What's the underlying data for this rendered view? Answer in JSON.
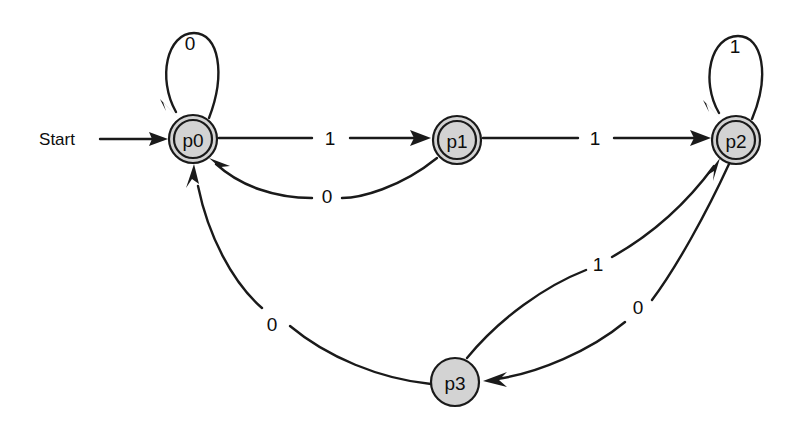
{
  "diagram": {
    "type": "state-machine",
    "background_color": "#ffffff",
    "stroke_color": "#1a1a1a",
    "node_fill_color": "#d3d3d3",
    "start_label": "Start",
    "alphabet": [
      "0",
      "1"
    ],
    "states": [
      {
        "id": "p0",
        "label": "p0",
        "accepting": true,
        "x": 193,
        "y": 139,
        "r_outer": 24,
        "r_inner": 19
      },
      {
        "id": "p1",
        "label": "p1",
        "accepting": true,
        "x": 457,
        "y": 140,
        "r_outer": 24,
        "r_inner": 19
      },
      {
        "id": "p2",
        "label": "p2",
        "accepting": true,
        "x": 736,
        "y": 140,
        "r_outer": 24,
        "r_inner": 19
      },
      {
        "id": "p3",
        "label": "p3",
        "accepting": false,
        "x": 455,
        "y": 382,
        "r_outer": 24,
        "r_inner": 0
      }
    ],
    "transitions": [
      {
        "id": "t-p0-p0",
        "from": "p0",
        "to": "p0",
        "label": "0",
        "label_x": 190,
        "label_y": 43,
        "kind": "self-loop"
      },
      {
        "id": "t-p0-p1",
        "from": "p0",
        "to": "p1",
        "label": "1",
        "label_x": 330,
        "label_y": 138,
        "kind": "straight"
      },
      {
        "id": "t-p1-p0",
        "from": "p1",
        "to": "p0",
        "label": "0",
        "label_x": 327,
        "label_y": 196,
        "kind": "curve"
      },
      {
        "id": "t-p1-p2",
        "from": "p1",
        "to": "p2",
        "label": "1",
        "label_x": 595,
        "label_y": 138,
        "kind": "straight"
      },
      {
        "id": "t-p2-p2",
        "from": "p2",
        "to": "p2",
        "label": "1",
        "label_x": 735,
        "label_y": 46,
        "kind": "self-loop"
      },
      {
        "id": "t-p2-p3",
        "from": "p2",
        "to": "p3",
        "label": "0",
        "label_x": 638,
        "label_y": 307,
        "kind": "curve"
      },
      {
        "id": "t-p3-p2",
        "from": "p3",
        "to": "p2",
        "label": "1",
        "label_x": 598,
        "label_y": 264,
        "kind": "curve"
      },
      {
        "id": "t-p3-p0",
        "from": "p3",
        "to": "p0",
        "label": "0",
        "label_x": 272,
        "label_y": 324,
        "kind": "curve"
      }
    ],
    "start_arrow": {
      "label": "Start",
      "label_x": 57,
      "label_y": 139,
      "from_x": 100,
      "to_x": 168,
      "y": 139
    }
  }
}
